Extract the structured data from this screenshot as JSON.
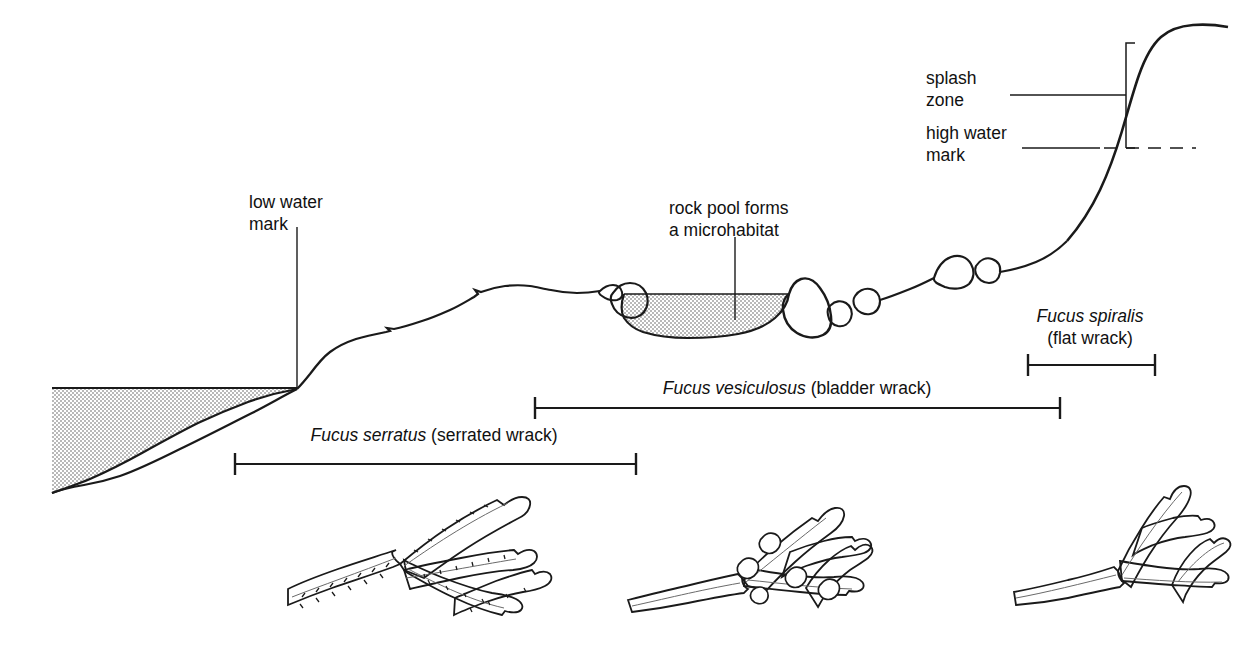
{
  "figure": {
    "type": "rocky-shore-zonation-profile",
    "background_color": "#ffffff",
    "ink_color": "#1a1a1a"
  },
  "annotations": {
    "splash_zone": {
      "line1": "splash",
      "line2": "zone"
    },
    "high_water_mark": {
      "line1": "high water",
      "line2": "mark"
    },
    "low_water_mark": {
      "line1": "low water",
      "line2": "mark"
    },
    "rock_pool": {
      "line1": "rock pool forms",
      "line2": "a microhabitat"
    }
  },
  "zones": [
    {
      "id": "fucus-serratus",
      "species": "Fucus serratus",
      "common_name": "(serrated wrack)",
      "label_x": 434,
      "label_y": 441,
      "bar_y": 464,
      "bar_x1": 235,
      "bar_x2": 636
    },
    {
      "id": "fucus-vesiculosus",
      "species": "Fucus vesiculosus",
      "common_name": "(bladder wrack)",
      "label_x": 797,
      "label_y": 394,
      "bar_y": 408,
      "bar_x1": 535,
      "bar_x2": 1060
    },
    {
      "id": "fucus-spiralis",
      "species": "Fucus spiralis",
      "common_name": "(flat wrack)",
      "label_x": 1090,
      "label_y": 322,
      "label_x2": 1090,
      "label_y2": 342,
      "bar_y": 365,
      "bar_x1": 1028,
      "bar_x2": 1155
    }
  ],
  "specimens": [
    {
      "id": "specimen-fucus-serratus",
      "name": "Fucus serratus frond",
      "feature": "serrated margins with midrib"
    },
    {
      "id": "specimen-fucus-vesiculosus",
      "name": "Fucus vesiculosus frond",
      "feature": "paired air bladders"
    },
    {
      "id": "specimen-fucus-spiralis",
      "name": "Fucus spiralis frond",
      "feature": "smooth margins with midrib"
    }
  ]
}
